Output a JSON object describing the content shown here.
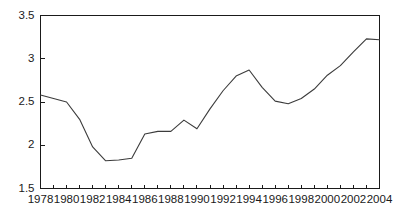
{
  "chart_data": {
    "type": "line",
    "title": "",
    "subtitle": "",
    "xlabel": "",
    "ylabel": "",
    "xlim": [
      1978,
      2004
    ],
    "ylim": [
      1.5,
      3.5
    ],
    "grid": false,
    "legend": null,
    "legend_position": "none",
    "line_color": "#3c3c3c",
    "axis_color": "#1a1a1a",
    "background_color": "#ffffff",
    "y_ticks": [
      "1.5",
      "2",
      "2.5",
      "3",
      "3.5"
    ],
    "y_tick_values": [
      1.5,
      2,
      2.5,
      3,
      3.5
    ],
    "x_ticks": [
      "1978",
      "1980",
      "1982",
      "1984",
      "1986",
      "1988",
      "1990",
      "1992",
      "1994",
      "1996",
      "1998",
      "2000",
      "2002",
      "2004"
    ],
    "x_tick_values": [
      1978,
      1980,
      1982,
      1984,
      1986,
      1988,
      1990,
      1992,
      1994,
      1996,
      1998,
      2000,
      2002,
      2004
    ],
    "x_minor_tick_values": [
      1979,
      1981,
      1983,
      1985,
      1987,
      1989,
      1991,
      1993,
      1995,
      1997,
      1999,
      2001,
      2003
    ],
    "x": [
      1978,
      1979,
      1980,
      1981,
      1982,
      1983,
      1984,
      1985,
      1986,
      1987,
      1988,
      1989,
      1990,
      1991,
      1992,
      1993,
      1994,
      1995,
      1996,
      1997,
      1998,
      1999,
      2000,
      2001,
      2002,
      2003,
      2004
    ],
    "values": [
      2.58,
      2.54,
      2.5,
      2.3,
      1.98,
      1.82,
      1.83,
      1.85,
      2.13,
      2.16,
      2.16,
      2.29,
      2.19,
      2.42,
      2.63,
      2.8,
      2.87,
      2.67,
      2.51,
      2.48,
      2.54,
      2.65,
      2.81,
      2.92,
      3.08,
      3.23,
      3.22
    ],
    "series": [
      {
        "name": "series-1",
        "values": [
          2.58,
          2.54,
          2.5,
          2.3,
          1.98,
          1.82,
          1.83,
          1.85,
          2.13,
          2.16,
          2.16,
          2.29,
          2.19,
          2.42,
          2.63,
          2.8,
          2.87,
          2.67,
          2.51,
          2.48,
          2.54,
          2.65,
          2.81,
          2.92,
          3.08,
          3.23,
          3.22
        ]
      }
    ]
  }
}
